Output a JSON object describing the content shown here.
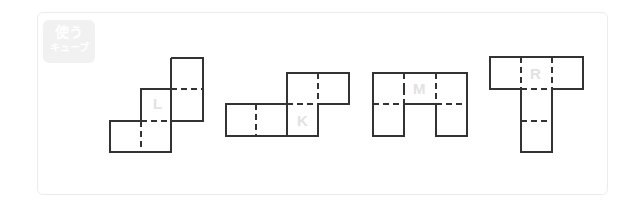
{
  "badge": {
    "line1": "使う",
    "line2": "キューブ"
  },
  "nets": [
    {
      "label": "L"
    },
    {
      "label": "K"
    },
    {
      "label": "M"
    },
    {
      "label": "R"
    }
  ],
  "colors": {
    "line": "#333333",
    "label": "#e2e2e2",
    "frame": "#ececec"
  }
}
